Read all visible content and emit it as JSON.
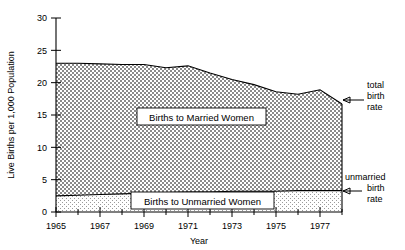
{
  "chart_data": {
    "type": "area",
    "title": "",
    "subtitle": "",
    "xlabel": "Year",
    "ylabel": "Live Births per 1,000 Population",
    "xlim": [
      1965,
      1978
    ],
    "ylim": [
      0,
      30
    ],
    "grid": false,
    "legend_position": "inline-annotations",
    "stacked": true,
    "x": [
      1965,
      1966,
      1967,
      1968,
      1969,
      1970,
      1971,
      1972,
      1973,
      1974,
      1975,
      1976,
      1977,
      1978
    ],
    "x_tick_labels": [
      "1965",
      "1967",
      "1969",
      "1971",
      "1973",
      "1975",
      "1977"
    ],
    "x_tick_values": [
      1965,
      1967,
      1969,
      1971,
      1973,
      1975,
      1977
    ],
    "y_tick_labels": [
      "0",
      "5",
      "10",
      "15",
      "20",
      "25",
      "30"
    ],
    "y_tick_values": [
      0,
      5,
      10,
      15,
      20,
      25,
      30
    ],
    "series": [
      {
        "name": "Births to Unmarried Women",
        "label": "Births to Unmarried Women",
        "fill": "dots",
        "values": [
          2.5,
          2.6,
          2.7,
          2.8,
          2.9,
          3.0,
          3.1,
          3.1,
          3.2,
          3.2,
          3.2,
          3.3,
          3.3,
          3.3
        ]
      },
      {
        "name": "Births to Married Women",
        "label": "Births to Married Women",
        "fill": "crosshatch",
        "values": [
          20.5,
          20.4,
          20.2,
          20.0,
          19.9,
          19.3,
          19.5,
          18.4,
          17.3,
          16.5,
          15.4,
          14.9,
          15.6,
          13.4
        ]
      }
    ],
    "total_birth_rate": [
      23.0,
      23.0,
      22.9,
      22.8,
      22.8,
      22.3,
      22.6,
      21.5,
      20.5,
      19.7,
      18.6,
      18.2,
      18.9,
      16.7
    ],
    "annotations": [
      {
        "id": "total-birth-rate",
        "text_lines": [
          "total",
          "birth",
          "rate"
        ],
        "points_to_year": 1978,
        "points_to_value": 16.7
      },
      {
        "id": "unmarried-birth-rate",
        "text_lines": [
          "unmarried",
          "birth",
          "rate"
        ],
        "points_to_year": 1978,
        "points_to_value": 3.3
      }
    ]
  }
}
